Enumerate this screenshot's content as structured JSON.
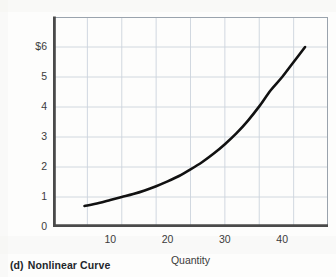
{
  "caption": {
    "index": "(d)",
    "text": "Nonlinear Curve"
  },
  "chart_data": {
    "type": "line",
    "title": "Nonlinear Curve",
    "xlabel": "Quantity",
    "ylabel": "Price (per pen)",
    "xlim": [
      0,
      48
    ],
    "ylim": [
      0,
      7
    ],
    "grid": true,
    "legend": null,
    "x_ticks": [
      10,
      20,
      30,
      40
    ],
    "x_tick_labels": [
      "10",
      "20",
      "30",
      "40"
    ],
    "y_ticks": [
      0,
      1,
      2,
      3,
      4,
      5,
      6
    ],
    "y_tick_labels": [
      "0",
      "1",
      "2",
      "3",
      "4",
      "5",
      "6"
    ],
    "y_top_label": "$6",
    "series": [
      {
        "name": "Price",
        "color": "#111111",
        "x": [
          5.5,
          8,
          10,
          12,
          14,
          16,
          18,
          20,
          22,
          24,
          26,
          28,
          30,
          32,
          34,
          36,
          38,
          40,
          42,
          44
        ],
        "y": [
          0.7,
          0.8,
          0.9,
          1.0,
          1.1,
          1.22,
          1.36,
          1.52,
          1.7,
          1.92,
          2.16,
          2.44,
          2.76,
          3.12,
          3.54,
          4.02,
          4.56,
          5.0,
          5.5,
          6.0
        ]
      }
    ],
    "colors": {
      "curve": "#111111",
      "grid": "#ccd4dd",
      "axis": "#3b3b3b",
      "text": "#3b3b3b",
      "caption": "#22262b"
    }
  }
}
